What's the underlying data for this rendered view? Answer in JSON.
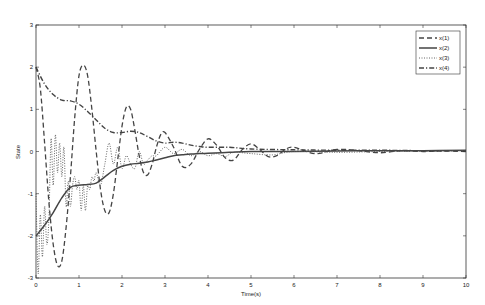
{
  "chart_data": {
    "type": "line",
    "title": "",
    "xlabel": "Time(s)",
    "ylabel": "State",
    "xlim": [
      0,
      10
    ],
    "ylim": [
      -3,
      3
    ],
    "xticks": [
      "0",
      "1",
      "2",
      "3",
      "4",
      "5",
      "6",
      "7",
      "8",
      "9",
      "10"
    ],
    "yticks": [
      "-3",
      "-2",
      "-1",
      "0",
      "1",
      "2",
      "3"
    ],
    "grid": false,
    "legend_position": "top-right",
    "legend": [
      "x(1)",
      "x(2)",
      "x(3)",
      "x(4)"
    ],
    "series": [
      {
        "name": "x(1)",
        "style": "dashed",
        "x": [
          0,
          0.1,
          0.2,
          0.3,
          0.4,
          0.5,
          0.6,
          0.7,
          0.8,
          0.9,
          1.0,
          1.1,
          1.2,
          1.3,
          1.4,
          1.5,
          1.6,
          1.7,
          1.8,
          1.9,
          2.0,
          2.1,
          2.2,
          2.3,
          2.4,
          2.5,
          2.6,
          2.7,
          2.8,
          2.9,
          3.0,
          3.2,
          3.4,
          3.6,
          3.8,
          4.0,
          4.2,
          4.4,
          4.6,
          4.8,
          5.0,
          5.2,
          5.4,
          5.6,
          5.8,
          6.0,
          6.5,
          7.0,
          7.5,
          8.0,
          8.5,
          9.0,
          9.5,
          10
        ],
        "y": [
          2.0,
          1.5,
          0.2,
          -1.2,
          -2.2,
          -2.7,
          -2.6,
          -1.8,
          -0.6,
          0.8,
          1.8,
          2.05,
          1.8,
          1.0,
          0.0,
          -0.9,
          -1.4,
          -1.45,
          -1.0,
          -0.2,
          0.6,
          1.05,
          1.0,
          0.5,
          -0.1,
          -0.5,
          -0.55,
          -0.3,
          0.1,
          0.4,
          0.45,
          0.1,
          -0.35,
          -0.3,
          0.05,
          0.3,
          0.15,
          -0.15,
          -0.2,
          0.05,
          0.18,
          0.05,
          -0.12,
          -0.1,
          0.05,
          0.1,
          -0.05,
          0.05,
          0.02,
          -0.03,
          0.02,
          0.0,
          0.01,
          0.0
        ]
      },
      {
        "name": "x(2)",
        "style": "solid",
        "x": [
          0,
          0.2,
          0.4,
          0.6,
          0.8,
          1.0,
          1.2,
          1.4,
          1.6,
          1.8,
          2.0,
          2.2,
          2.4,
          2.6,
          2.8,
          3.0,
          3.2,
          3.4,
          3.6,
          3.8,
          4.0,
          4.5,
          5.0,
          6.0,
          7.0,
          8.0,
          9.0,
          10
        ],
        "y": [
          -2.0,
          -1.75,
          -1.45,
          -1.1,
          -0.85,
          -0.8,
          -0.78,
          -0.75,
          -0.6,
          -0.45,
          -0.35,
          -0.3,
          -0.28,
          -0.25,
          -0.2,
          -0.15,
          -0.1,
          -0.08,
          -0.06,
          -0.05,
          -0.04,
          -0.02,
          0.0,
          0.0,
          0.01,
          0.02,
          0.02,
          0.03
        ]
      },
      {
        "name": "x(3)",
        "style": "dotted",
        "x": [
          0,
          0.05,
          0.1,
          0.15,
          0.2,
          0.25,
          0.3,
          0.35,
          0.4,
          0.45,
          0.5,
          0.55,
          0.6,
          0.65,
          0.7,
          0.75,
          0.8,
          0.85,
          0.9,
          0.95,
          1.0,
          1.05,
          1.1,
          1.15,
          1.2,
          1.25,
          1.3,
          1.35,
          1.4,
          1.5,
          1.6,
          1.7,
          1.8,
          1.9,
          2.0,
          2.1,
          2.2,
          2.3,
          2.4,
          2.5,
          2.6,
          2.7,
          2.8,
          3.0,
          3.2,
          3.4,
          3.6,
          3.8,
          4.0,
          4.2,
          4.4,
          4.6,
          5.0,
          5.5,
          6.0,
          7.0,
          8.0,
          9.0,
          10
        ],
        "y": [
          -1.0,
          -2.9,
          -1.5,
          -2.5,
          -1.3,
          -2.2,
          -1.6,
          0.3,
          -0.8,
          0.4,
          -0.5,
          0.2,
          -0.6,
          0.1,
          -1.3,
          -0.7,
          -1.3,
          -0.8,
          -0.6,
          -0.9,
          -0.7,
          -1.4,
          -0.8,
          -1.4,
          -0.8,
          -0.9,
          -0.6,
          -0.7,
          -0.5,
          -0.8,
          -0.3,
          0.2,
          -0.3,
          0.1,
          -0.4,
          -0.1,
          -0.3,
          -0.4,
          0.0,
          -0.3,
          -0.2,
          -0.1,
          -0.1,
          0.1,
          -0.05,
          0.05,
          -0.1,
          0.0,
          -0.1,
          -0.05,
          -0.12,
          -0.02,
          -0.05,
          -0.08,
          0.0,
          -0.02,
          0.0,
          0.01,
          0.02
        ]
      },
      {
        "name": "x(4)",
        "style": "dashdot",
        "x": [
          0,
          0.2,
          0.4,
          0.6,
          0.8,
          1.0,
          1.2,
          1.4,
          1.6,
          1.8,
          2.0,
          2.2,
          2.4,
          2.6,
          2.8,
          3.0,
          3.2,
          3.4,
          3.6,
          3.8,
          4.0,
          4.5,
          5.0,
          6.0,
          7.0,
          8.0,
          9.0,
          10
        ],
        "y": [
          2.0,
          1.6,
          1.35,
          1.22,
          1.2,
          1.12,
          0.95,
          0.75,
          0.55,
          0.45,
          0.45,
          0.48,
          0.45,
          0.35,
          0.25,
          0.2,
          0.22,
          0.2,
          0.15,
          0.12,
          0.1,
          0.1,
          0.06,
          0.04,
          0.03,
          0.03,
          0.02,
          0.02
        ]
      }
    ]
  }
}
